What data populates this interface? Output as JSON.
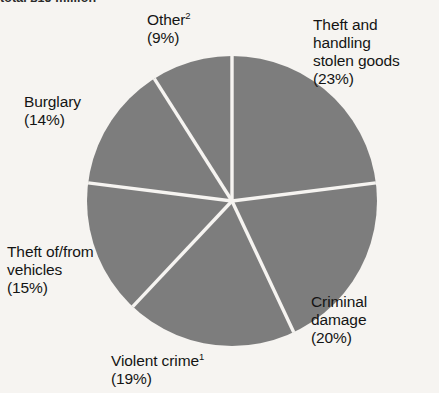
{
  "figure": {
    "clipped_title": "total £15 million"
  },
  "chart_data": {
    "type": "pie",
    "title": "",
    "legend_position": "callout-labels",
    "grid": false,
    "units": "percent",
    "total": 100,
    "start_angle_deg": 0,
    "direction": "clockwise",
    "slice_color": "#7d7d7d",
    "divider_color": "#f6f4f1",
    "background_color": "#f6f4f1",
    "categories": [
      "Theft and handling stolen goods",
      "Criminal damage",
      "Violent crime",
      "Theft of/from vehicles",
      "Burglary",
      "Other"
    ],
    "values": [
      23,
      20,
      19,
      15,
      14,
      9
    ],
    "labels": [
      {
        "name": "theft-handling",
        "lines": [
          "Theft and",
          "handling",
          "stolen goods"
        ],
        "footnote": "",
        "percent_text": "(23%)",
        "value": 23
      },
      {
        "name": "criminal-damage",
        "lines": [
          "Criminal",
          "damage"
        ],
        "footnote": "",
        "percent_text": "(20%)",
        "value": 20
      },
      {
        "name": "violent-crime",
        "lines": [
          "Violent crime"
        ],
        "footnote": "1",
        "percent_text": "(19%)",
        "value": 19
      },
      {
        "name": "theft-vehicles",
        "lines": [
          "Theft of/from",
          "vehicles"
        ],
        "footnote": "",
        "percent_text": "(15%)",
        "value": 15
      },
      {
        "name": "burglary",
        "lines": [
          "Burglary"
        ],
        "footnote": "",
        "percent_text": "(14%)",
        "value": 14
      },
      {
        "name": "other",
        "lines": [
          "Other"
        ],
        "footnote": "2",
        "percent_text": "(9%)",
        "value": 9
      }
    ]
  },
  "labels": {
    "other": {
      "line1": "Other",
      "footnote": "2",
      "pct": "(9%)"
    },
    "theft_handling": {
      "line1": "Theft and",
      "line2": "handling",
      "line3": "stolen goods",
      "pct": "(23%)"
    },
    "burglary": {
      "line1": "Burglary",
      "pct": "(14%)"
    },
    "theft_vehicles": {
      "line1": "Theft of/from",
      "line2": "vehicles",
      "pct": "(15%)"
    },
    "violent": {
      "line1": "Violent crime",
      "footnote": "1",
      "pct": "(19%)"
    },
    "criminal_damage": {
      "line1": "Criminal",
      "line2": "damage",
      "pct": "(20%)"
    }
  }
}
